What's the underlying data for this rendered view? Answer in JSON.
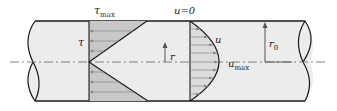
{
  "labels": {
    "tau_max": {
      "base": "τ",
      "sub": "max"
    },
    "tau": "τ",
    "r": "r",
    "u_zero": "u=0",
    "u": "u",
    "u_max": {
      "base": "u",
      "sub": "max"
    },
    "r0": {
      "base": "r",
      "sub": "0"
    }
  },
  "colors": {
    "pipe_fill": "#ececec",
    "shear_fill": "#c8c8c8",
    "velocity_fill": "#dcdcdc",
    "outline": "#1a1a1a",
    "centerline": "#666666",
    "arrows": "#888888"
  },
  "shear_profile": {
    "description": "linear, zero at centerline, maximum at wall",
    "arrow_count_each_half": 4
  },
  "velocity_profile": {
    "description": "parabolic, zero at wall, maximum at centerline",
    "arrow_count": 10
  }
}
